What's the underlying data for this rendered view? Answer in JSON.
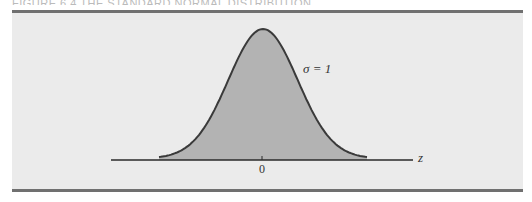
{
  "figure": {
    "caption_partial": "FIGURE 6.4   THE STANDARD NORMAL DISTRIBUTION"
  },
  "chart_data": {
    "type": "area",
    "title": "Standard normal distribution",
    "distribution": "normal",
    "mean": 0,
    "std_dev": 1,
    "annotation": "σ = 1",
    "xlabel": "z",
    "ylabel": "",
    "x_ticks": [
      0
    ],
    "x_tick_labels": [
      "0"
    ],
    "xlim": [
      -3,
      3
    ],
    "fill_color": "#b3b3b3",
    "line_color": "#3a3a3a",
    "background_color": "#ebebeb",
    "grid": false,
    "legend": null
  },
  "labels": {
    "sigma": "σ = 1",
    "axis_var": "z",
    "tick_zero": "0"
  }
}
